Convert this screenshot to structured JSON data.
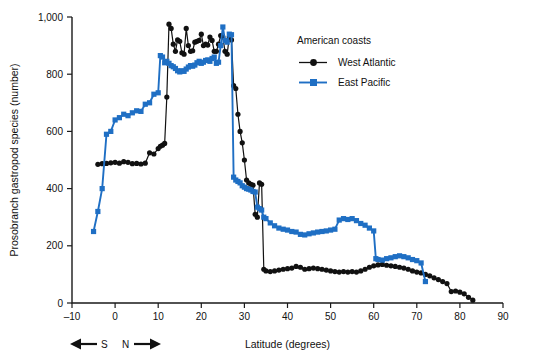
{
  "chart_data": {
    "type": "line",
    "title": "",
    "xlabel": "Latitude (degrees)",
    "ylabel": "Prosobranch gastropod species (number)",
    "xlim": [
      -10,
      90
    ],
    "ylim": [
      0,
      1000
    ],
    "xticks": [
      -10,
      0,
      10,
      20,
      30,
      40,
      50,
      60,
      70,
      80,
      90
    ],
    "xticklabels": [
      "–10",
      "0",
      "10",
      "20",
      "30",
      "40",
      "50",
      "60",
      "70",
      "80",
      "90"
    ],
    "yticks": [
      0,
      200,
      400,
      600,
      800,
      1000
    ],
    "yticklabels": [
      "0",
      "200",
      "400",
      "600",
      "800",
      "1,000"
    ],
    "grid": false,
    "legend_position": "upper-right-inside",
    "legend_title": "American coasts",
    "axis_annotation": {
      "south_arrow": "←",
      "south_label": "S",
      "north_label": "N",
      "north_arrow": "→"
    },
    "series": [
      {
        "name": "West Atlantic",
        "color": "#111111",
        "marker": "circle",
        "points": [
          [
            -4,
            485
          ],
          [
            -3,
            487
          ],
          [
            -2,
            488
          ],
          [
            -1,
            490
          ],
          [
            0,
            492
          ],
          [
            1,
            489
          ],
          [
            2,
            494
          ],
          [
            3,
            492
          ],
          [
            4,
            487
          ],
          [
            5,
            488
          ],
          [
            6,
            486
          ],
          [
            7,
            489
          ],
          [
            8,
            525
          ],
          [
            9,
            521
          ],
          [
            10,
            540
          ],
          [
            10.5,
            548
          ],
          [
            11,
            552
          ],
          [
            11.5,
            558
          ],
          [
            12,
            720
          ],
          [
            12.5,
            975
          ],
          [
            13,
            960
          ],
          [
            13.5,
            905
          ],
          [
            14,
            880
          ],
          [
            14.5,
            920
          ],
          [
            15,
            915
          ],
          [
            15.5,
            875
          ],
          [
            16,
            870
          ],
          [
            16.5,
            960
          ],
          [
            17,
            900
          ],
          [
            17.5,
            880
          ],
          [
            18,
            882
          ],
          [
            18.5,
            912
          ],
          [
            19,
            915
          ],
          [
            19.5,
            918
          ],
          [
            20,
            940
          ],
          [
            20.5,
            900
          ],
          [
            21,
            905
          ],
          [
            21.5,
            902
          ],
          [
            22,
            930
          ],
          [
            22.5,
            918
          ],
          [
            23,
            880
          ],
          [
            23.5,
            880
          ],
          [
            24,
            905
          ],
          [
            24.5,
            935
          ],
          [
            25,
            930
          ],
          [
            25.5,
            880
          ],
          [
            26,
            870
          ],
          [
            26.5,
            930
          ],
          [
            27,
            920
          ],
          [
            27.5,
            760
          ],
          [
            28,
            750
          ],
          [
            28.5,
            660
          ],
          [
            29,
            600
          ],
          [
            29.5,
            560
          ],
          [
            30,
            500
          ],
          [
            30.5,
            430
          ],
          [
            31,
            420
          ],
          [
            31.5,
            415
          ],
          [
            32,
            412
          ],
          [
            32.5,
            310
          ],
          [
            33,
            300
          ],
          [
            33.5,
            420
          ],
          [
            34,
            415
          ],
          [
            34.5,
            118
          ],
          [
            35,
            112
          ],
          [
            36,
            110
          ],
          [
            37,
            112
          ],
          [
            38,
            115
          ],
          [
            39,
            118
          ],
          [
            40,
            120
          ],
          [
            41,
            122
          ],
          [
            42,
            128
          ],
          [
            43,
            125
          ],
          [
            44,
            118
          ],
          [
            45,
            120
          ],
          [
            46,
            122
          ],
          [
            47,
            120
          ],
          [
            48,
            118
          ],
          [
            49,
            115
          ],
          [
            50,
            112
          ],
          [
            51,
            110
          ],
          [
            52,
            108
          ],
          [
            53,
            110
          ],
          [
            54,
            108
          ],
          [
            55,
            110
          ],
          [
            56,
            108
          ],
          [
            57,
            112
          ],
          [
            58,
            118
          ],
          [
            59,
            125
          ],
          [
            60,
            130
          ],
          [
            61,
            133
          ],
          [
            62,
            135
          ],
          [
            63,
            132
          ],
          [
            64,
            130
          ],
          [
            65,
            128
          ],
          [
            66,
            125
          ],
          [
            67,
            122
          ],
          [
            68,
            118
          ],
          [
            69,
            112
          ],
          [
            70,
            108
          ],
          [
            71,
            105
          ],
          [
            72,
            100
          ],
          [
            73,
            95
          ],
          [
            74,
            88
          ],
          [
            75,
            82
          ],
          [
            76,
            75
          ],
          [
            77,
            68
          ],
          [
            78,
            40
          ],
          [
            79,
            42
          ],
          [
            80,
            38
          ],
          [
            81,
            32
          ],
          [
            82,
            20
          ],
          [
            83,
            10
          ]
        ]
      },
      {
        "name": "East Pacific",
        "color": "#1F6FC4",
        "marker": "square",
        "points": [
          [
            -5,
            250
          ],
          [
            -4,
            320
          ],
          [
            -3,
            400
          ],
          [
            -2,
            590
          ],
          [
            -1,
            600
          ],
          [
            0,
            640
          ],
          [
            1,
            648
          ],
          [
            2,
            660
          ],
          [
            3,
            655
          ],
          [
            4,
            665
          ],
          [
            5,
            672
          ],
          [
            6,
            670
          ],
          [
            7,
            695
          ],
          [
            8,
            700
          ],
          [
            9,
            730
          ],
          [
            10,
            735
          ],
          [
            10.5,
            865
          ],
          [
            11,
            860
          ],
          [
            11.5,
            840
          ],
          [
            12,
            845
          ],
          [
            12.5,
            838
          ],
          [
            13,
            830
          ],
          [
            13.5,
            826
          ],
          [
            14,
            820
          ],
          [
            14.5,
            812
          ],
          [
            15,
            808
          ],
          [
            15.5,
            812
          ],
          [
            16,
            810
          ],
          [
            16.5,
            818
          ],
          [
            17,
            825
          ],
          [
            17.5,
            830
          ],
          [
            18,
            828
          ],
          [
            18.5,
            832
          ],
          [
            19,
            840
          ],
          [
            19.5,
            845
          ],
          [
            20,
            838
          ],
          [
            20.5,
            842
          ],
          [
            21,
            848
          ],
          [
            21.5,
            850
          ],
          [
            22,
            845
          ],
          [
            22.5,
            855
          ],
          [
            23,
            860
          ],
          [
            23.5,
            838
          ],
          [
            24,
            842
          ],
          [
            24.5,
            900
          ],
          [
            25,
            965
          ],
          [
            25.5,
            918
          ],
          [
            26,
            912
          ],
          [
            26.5,
            940
          ],
          [
            27,
            938
          ],
          [
            27.5,
            440
          ],
          [
            28,
            430
          ],
          [
            28.5,
            425
          ],
          [
            29,
            420
          ],
          [
            29.5,
            410
          ],
          [
            30,
            405
          ],
          [
            30.5,
            400
          ],
          [
            31,
            398
          ],
          [
            31.5,
            395
          ],
          [
            32,
            390
          ],
          [
            32.5,
            388
          ],
          [
            33,
            335
          ],
          [
            33.5,
            330
          ],
          [
            34,
            325
          ],
          [
            34.5,
            300
          ],
          [
            35,
            295
          ],
          [
            36,
            280
          ],
          [
            37,
            270
          ],
          [
            38,
            262
          ],
          [
            39,
            258
          ],
          [
            40,
            255
          ],
          [
            41,
            250
          ],
          [
            42,
            248
          ],
          [
            43,
            240
          ],
          [
            44,
            238
          ],
          [
            45,
            242
          ],
          [
            46,
            245
          ],
          [
            47,
            248
          ],
          [
            48,
            250
          ],
          [
            49,
            252
          ],
          [
            50,
            255
          ],
          [
            51,
            258
          ],
          [
            52,
            290
          ],
          [
            53,
            295
          ],
          [
            54,
            292
          ],
          [
            55,
            295
          ],
          [
            56,
            288
          ],
          [
            57,
            278
          ],
          [
            58,
            272
          ],
          [
            59,
            262
          ],
          [
            60,
            252
          ],
          [
            60.5,
            155
          ],
          [
            61,
            152
          ],
          [
            62,
            150
          ],
          [
            63,
            155
          ],
          [
            64,
            158
          ],
          [
            65,
            162
          ],
          [
            66,
            165
          ],
          [
            67,
            162
          ],
          [
            68,
            158
          ],
          [
            69,
            152
          ],
          [
            70,
            148
          ],
          [
            71,
            140
          ],
          [
            72,
            75
          ]
        ]
      }
    ]
  },
  "legend": {
    "title": "American coasts",
    "entries": [
      {
        "label": "West Atlantic",
        "color": "#111111",
        "marker": "circle"
      },
      {
        "label": "East Pacific",
        "color": "#1F6FC4",
        "marker": "square"
      }
    ]
  }
}
